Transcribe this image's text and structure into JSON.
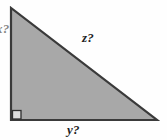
{
  "figure": {
    "type": "right-triangle-diagram",
    "background_color": "#fefefe",
    "fill_color": "#a8a8a8",
    "stroke_color": "#3a3a3a",
    "geometry": {
      "apex": [
        11,
        8
      ],
      "right_angle_vertex": [
        11,
        120
      ],
      "far_vertex": [
        157,
        120
      ],
      "right_angle_marker": {
        "x": 12,
        "y": 110,
        "size": 9
      }
    },
    "labels": {
      "hypotenuse": "z?",
      "base": "y?",
      "vertical_clipped": "x?"
    }
  }
}
